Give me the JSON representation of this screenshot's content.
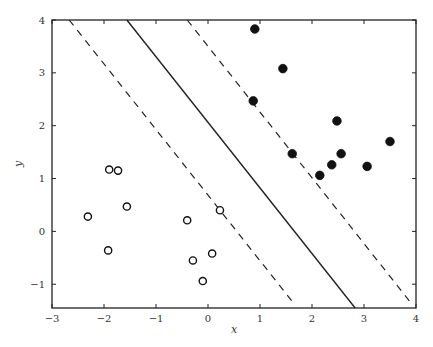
{
  "chart_data": {
    "type": "scatter",
    "title": "",
    "xlabel": "x",
    "ylabel": "y",
    "xlim": [
      -3,
      4
    ],
    "ylim": [
      -1.45,
      4
    ],
    "xticks": [
      -3,
      -2,
      -1,
      0,
      1,
      2,
      3,
      4
    ],
    "yticks": [
      -1,
      0,
      1,
      2,
      3,
      4
    ],
    "xtick_labels": [
      "−3",
      "−2",
      "−1",
      "0",
      "1",
      "2",
      "3",
      "4"
    ],
    "ytick_labels": [
      "−1",
      "0",
      "1",
      "2",
      "3",
      "4"
    ],
    "grid": false,
    "legend": null,
    "series": [
      {
        "name": "class-positive",
        "marker": "filled-circle",
        "color": "#111111",
        "points": [
          [
            0.9,
            3.83
          ],
          [
            1.44,
            3.08
          ],
          [
            0.87,
            2.47
          ],
          [
            2.48,
            2.09
          ],
          [
            1.62,
            1.47
          ],
          [
            2.56,
            1.47
          ],
          [
            2.38,
            1.26
          ],
          [
            3.06,
            1.23
          ],
          [
            3.5,
            1.7
          ],
          [
            2.15,
            1.06
          ]
        ]
      },
      {
        "name": "class-negative",
        "marker": "open-circle",
        "color": "#111111",
        "points": [
          [
            -1.9,
            1.17
          ],
          [
            -1.73,
            1.15
          ],
          [
            -1.56,
            0.47
          ],
          [
            -2.31,
            0.28
          ],
          [
            -1.92,
            -0.36
          ],
          [
            0.23,
            0.4
          ],
          [
            -0.4,
            0.21
          ],
          [
            0.08,
            -0.42
          ],
          [
            -0.29,
            -0.55
          ],
          [
            -0.1,
            -0.94
          ]
        ]
      }
    ],
    "lines": [
      {
        "name": "decision-boundary",
        "style": "solid",
        "from": [
          -1.56,
          4
        ],
        "to": [
          2.83,
          -1.45
        ]
      },
      {
        "name": "margin-lower",
        "style": "dashed",
        "from": [
          -2.67,
          4
        ],
        "to": [
          1.64,
          -1.35
        ]
      },
      {
        "name": "margin-upper",
        "style": "dashed",
        "from": [
          -0.4,
          4
        ],
        "to": [
          3.9,
          -1.35
        ]
      }
    ]
  }
}
